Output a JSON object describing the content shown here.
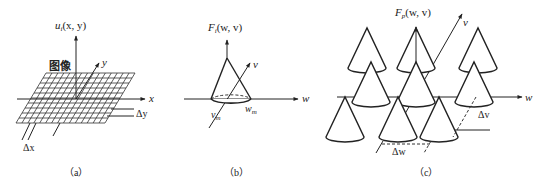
{
  "panels": {
    "a": {
      "caption": "（a）",
      "vertical_axis_label": "u",
      "vertical_axis_sub": "i",
      "vertical_axis_args": "(x,  y)",
      "x_axis_label": "x",
      "y_axis_label": "y",
      "image_label": "图像",
      "delta_y_label": "Δy",
      "delta_x_label": "Δx"
    },
    "b": {
      "caption": "（b）",
      "vertical_axis_label": "F",
      "vertical_axis_sub": "i",
      "vertical_axis_args": "(w,  v)",
      "w_axis_label": "w",
      "v_axis_label": "v",
      "w_m_label": "w",
      "w_m_sub": "m",
      "v_m_label": "v",
      "v_m_sub": "m"
    },
    "c": {
      "caption": "（c）",
      "vertical_axis_label": "F",
      "vertical_axis_sub": "p",
      "vertical_axis_args": "(w,  v)",
      "w_axis_label": "w",
      "v_axis_label": "v",
      "delta_v_label": "Δv",
      "delta_w_label": "Δw"
    }
  }
}
